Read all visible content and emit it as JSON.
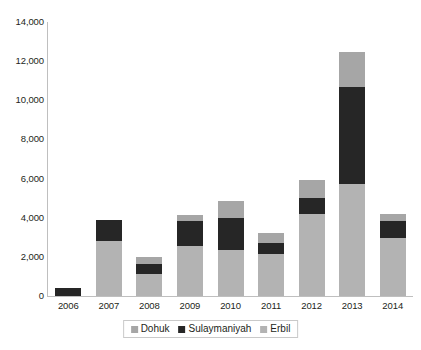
{
  "chart_data": {
    "type": "bar",
    "stacked": true,
    "title": "",
    "subtitle": "",
    "xlabel": "",
    "ylabel": "",
    "categories": [
      "2006",
      "2007",
      "2008",
      "2009",
      "2010",
      "2011",
      "2012",
      "2013",
      "2014"
    ],
    "series": [
      {
        "name": "Erbil",
        "color": "#b3b3b3",
        "values": [
          0,
          2800,
          1150,
          2550,
          2350,
          2150,
          4200,
          5700,
          2950
        ]
      },
      {
        "name": "Sulaymaniyah",
        "color": "#262626",
        "values": [
          400,
          1100,
          500,
          1300,
          1650,
          550,
          800,
          5000,
          900
        ]
      },
      {
        "name": "Dohuk",
        "color": "#a6a6a6",
        "values": [
          0,
          0,
          350,
          300,
          850,
          500,
          950,
          1750,
          350
        ]
      }
    ],
    "totals": [
      400,
      3900,
      2000,
      4150,
      4850,
      3200,
      5950,
      12450,
      4200
    ],
    "ylim": [
      0,
      14000
    ],
    "ytick_values": [
      0,
      2000,
      4000,
      6000,
      8000,
      10000,
      12000,
      14000
    ],
    "ytick_labels": [
      "0",
      "2,000",
      "4,000",
      "6,000",
      "8,000",
      "10,000",
      "12,000",
      "14,000"
    ],
    "grid": false,
    "legend_position": "bottom",
    "stack_order_bottom_to_top": [
      "Erbil",
      "Sulaymaniyah",
      "Dohuk"
    ]
  },
  "legend": {
    "items": [
      {
        "label": "Dohuk",
        "color": "#a6a6a6"
      },
      {
        "label": "Sulaymaniyah",
        "color": "#262626"
      },
      {
        "label": "Erbil",
        "color": "#b3b3b3"
      }
    ]
  },
  "colors": {
    "dohuk": "#a6a6a6",
    "sulaymaniyah": "#262626",
    "erbil": "#b3b3b3",
    "axis": "#bfbfbf",
    "text": "#231f20",
    "background": "#ffffff"
  }
}
